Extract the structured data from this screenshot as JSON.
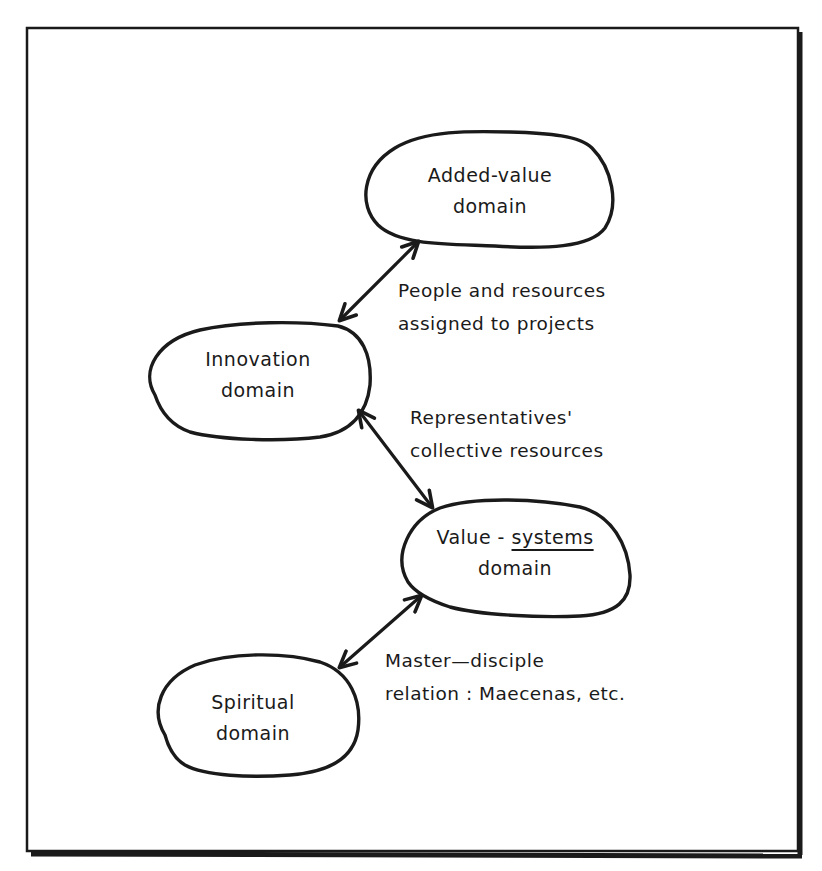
{
  "diagram": {
    "type": "concept-map",
    "style": "hand-drawn",
    "colors": {
      "ink": "#1a1a1a",
      "background": "#ffffff"
    },
    "nodes": [
      {
        "id": "added-value",
        "line1": "Added-value",
        "line2": "domain"
      },
      {
        "id": "innovation",
        "line1": "Innovation",
        "line2": "domain"
      },
      {
        "id": "value-systems",
        "line1_pre": "Value - ",
        "line1_underlined": "systems",
        "line2": "domain"
      },
      {
        "id": "spiritual",
        "line1": "Spiritual",
        "line2": "domain"
      }
    ],
    "edges": [
      {
        "from": "innovation",
        "to": "added-value",
        "direction": "bidirectional",
        "label_line1": "People and resources",
        "label_line2": "assigned to projects"
      },
      {
        "from": "innovation",
        "to": "value-systems",
        "direction": "bidirectional",
        "label_line1": "Representatives'",
        "label_line2": "collective resources"
      },
      {
        "from": "spiritual",
        "to": "value-systems",
        "direction": "bidirectional",
        "label_line1": "Master—disciple",
        "label_line2": "relation : Maecenas, etc."
      }
    ]
  }
}
